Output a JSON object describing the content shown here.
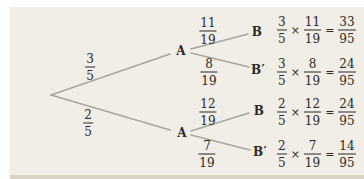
{
  "colors": {
    "page_background": "#fdfdfc",
    "panel_background": "#f1eee7",
    "panel_bottom_edge": "#d9d3c4",
    "branch_line": "#aaa69c",
    "text": "#2b2925"
  },
  "tree": {
    "nodes": [
      {
        "id": "a-top",
        "label": "A"
      },
      {
        "id": "a-bottom",
        "label": "A"
      },
      {
        "id": "b-top",
        "label": "B"
      },
      {
        "id": "b-prime-top",
        "label": "B′"
      },
      {
        "id": "b-bottom",
        "label": "B"
      },
      {
        "id": "b-prime-bottom",
        "label": "B′"
      }
    ],
    "branch_labels": [
      {
        "id": "root-to-a-top",
        "num": "3",
        "den": "5"
      },
      {
        "id": "root-to-a-bottom",
        "num": "2",
        "den": "5"
      },
      {
        "id": "a-top-to-b",
        "num": "11",
        "den": "19"
      },
      {
        "id": "a-top-to-b-prime",
        "num": "8",
        "den": "19"
      },
      {
        "id": "a-bottom-to-b",
        "num": "12",
        "den": "19"
      },
      {
        "id": "a-bottom-to-b-prime",
        "num": "7",
        "den": "19"
      }
    ]
  },
  "calculations": [
    {
      "a_num": "3",
      "a_den": "5",
      "times": "×",
      "b_num": "11",
      "b_den": "19",
      "equals": "=",
      "r_num": "33",
      "r_den": "95"
    },
    {
      "a_num": "3",
      "a_den": "5",
      "times": "×",
      "b_num": "8",
      "b_den": "19",
      "equals": "=",
      "r_num": "24",
      "r_den": "95"
    },
    {
      "a_num": "2",
      "a_den": "5",
      "times": "×",
      "b_num": "12",
      "b_den": "19",
      "equals": "=",
      "r_num": "24",
      "r_den": "95"
    },
    {
      "a_num": "2",
      "a_den": "5",
      "times": "×",
      "b_num": "7",
      "b_den": "19",
      "equals": "=",
      "r_num": "14",
      "r_den": "95"
    }
  ]
}
